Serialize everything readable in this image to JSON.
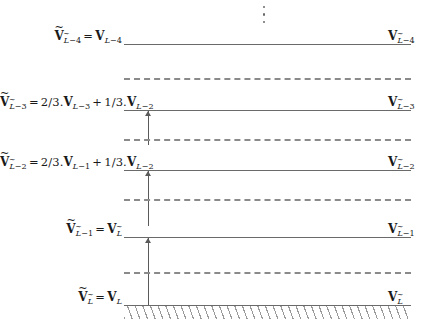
{
  "figure": {
    "type": "diagram",
    "width": 435,
    "height": 333,
    "background_color": "#ffffff",
    "line_color": "#6a6a6a",
    "dashed_color": "#8a8a8a",
    "arrow_color": "#5a5a5a",
    "hatch_color": "#9a9a9a",
    "vdots_symbol": "⋮"
  },
  "levels": [
    {
      "id": "level-L-4",
      "left_label": "Ṽ_{L̃-4} = V_{L-4}",
      "right_label": "V_{L̃-4}",
      "left_parts": {
        "lhs_symbol": "V",
        "lhs_sub": "L̃−4",
        "equals": "=",
        "rhs_symbol": "V",
        "rhs_sub": "L−4"
      },
      "right_parts": {
        "symbol": "V",
        "sub": "L̃−4"
      },
      "line_style": "solid"
    },
    {
      "id": "level-L-3",
      "left_label": "Ṽ_{L̃-3} = 2/3.V_{L-3} + 1/3.V_{L-2}",
      "right_label": "V_{L̃-3}",
      "left_parts": {
        "lhs_symbol": "V",
        "lhs_sub": "L̃−3",
        "equals": "=",
        "coef1": "2/3.",
        "term1_symbol": "V",
        "term1_sub": "L−3",
        "plus": "+",
        "coef2": "1/3.",
        "term2_symbol": "V",
        "term2_sub": "L−2"
      },
      "right_parts": {
        "symbol": "V",
        "sub": "L̃−3"
      },
      "line_style": "solid"
    },
    {
      "id": "level-L-2",
      "left_label": "Ṽ_{L̃-2} = 2/3.V_{L-1} + 1/3.V_{L-2}",
      "right_label": "V_{L̃-2}",
      "left_parts": {
        "lhs_symbol": "V",
        "lhs_sub": "L̃−2",
        "equals": "=",
        "coef1": "2/3.",
        "term1_symbol": "V",
        "term1_sub": "L−1",
        "plus": "+",
        "coef2": "1/3.",
        "term2_symbol": "V",
        "term2_sub": "L−2"
      },
      "right_parts": {
        "symbol": "V",
        "sub": "L̃−2"
      },
      "line_style": "solid"
    },
    {
      "id": "level-L-1",
      "left_label": "Ṽ_{L̃-1} = V_{L̃}",
      "right_label": "V_{L̃-1}",
      "left_parts": {
        "lhs_symbol": "V",
        "lhs_sub": "L̃−1",
        "equals": "=",
        "rhs_symbol": "V",
        "rhs_sub": "L̃"
      },
      "right_parts": {
        "symbol": "V",
        "sub": "L̃−1"
      },
      "line_style": "solid"
    },
    {
      "id": "level-L",
      "left_label": "Ṽ_{L̃} = V_{L}",
      "right_label": "V_{L̃}",
      "left_parts": {
        "lhs_symbol": "V",
        "lhs_sub": "L̃",
        "equals": "=",
        "rhs_symbol": "V",
        "rhs_sub": "L"
      },
      "right_parts": {
        "symbol": "V",
        "sub": "L̃"
      },
      "line_style": "solid"
    }
  ],
  "dashed_levels": [
    {
      "id": "dashed-top",
      "between": "level-L-4 and level-L-3"
    },
    {
      "id": "dashed-mid-upper",
      "between": "level-L-3 and level-L-2"
    },
    {
      "id": "dashed-mid-lower",
      "between": "level-L-2 and level-L-1"
    },
    {
      "id": "dashed-bottom",
      "between": "level-L-1 and level-L"
    }
  ],
  "arrows": [
    {
      "id": "arrow-upper",
      "from_level": "level-L-2",
      "to_level": "level-L-3",
      "direction": "up"
    },
    {
      "id": "arrow-mid",
      "from_level": "level-L-1",
      "to_level": "level-L-2",
      "direction": "up"
    },
    {
      "id": "arrow-lower",
      "from_level": "level-L",
      "to_level": "level-L-1",
      "direction": "up"
    }
  ]
}
